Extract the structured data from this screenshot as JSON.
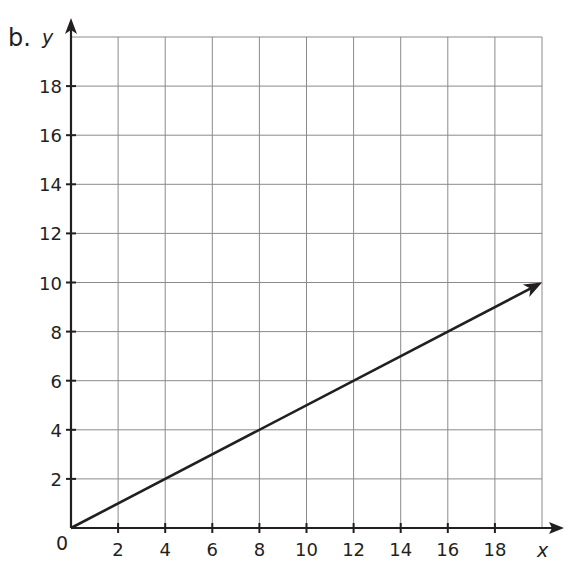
{
  "part_label": "b.",
  "chart_data": {
    "type": "line",
    "title": "",
    "xlabel": "x",
    "ylabel": "y",
    "xlim": [
      0,
      20
    ],
    "ylim": [
      0,
      20
    ],
    "grid": true,
    "origin_label": "0",
    "x_ticks": [
      2,
      4,
      6,
      8,
      10,
      12,
      14,
      16,
      18
    ],
    "y_ticks": [
      2,
      4,
      6,
      8,
      10,
      12,
      14,
      16,
      18
    ],
    "series": [
      {
        "name": "line",
        "x": [
          0,
          20
        ],
        "y": [
          0,
          10
        ],
        "arrow_end": true
      }
    ]
  },
  "colors": {
    "axis": "#231f20",
    "grid": "#8a8a8a",
    "line": "#231f20"
  }
}
